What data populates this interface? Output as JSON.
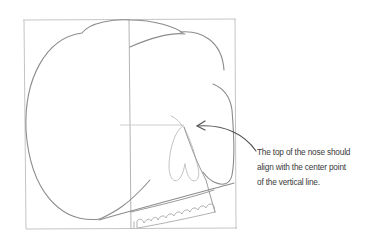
{
  "figure": {
    "annotation": {
      "lines": [
        "The top of the nose should",
        "align with the center point",
        "of the vertical line."
      ]
    },
    "colors": {
      "background": "#ffffff",
      "guide_lines": "#b5b5b5",
      "skull_outline": "#8a8a8a",
      "nose_outline": "#c4c4c4",
      "arrow": "#555555",
      "text": "#3a3a3a"
    }
  }
}
